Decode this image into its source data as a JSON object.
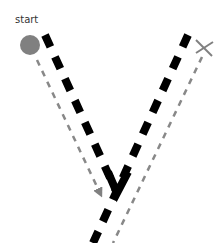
{
  "diagram": {
    "start_label": "start",
    "colors": {
      "background": "#ffffff",
      "main_path": "#000000",
      "guide_path": "#888888",
      "start_marker": "#808080",
      "end_marker": "#808080",
      "text": "#333333"
    },
    "elements": {
      "start_marker": "filled-circle",
      "end_marker": "x-cross",
      "main_path": "thick-black-dashed-v",
      "guide_path_left": "thin-gray-dashed-arrow",
      "guide_path_right": "thin-gray-dashed-line"
    }
  }
}
